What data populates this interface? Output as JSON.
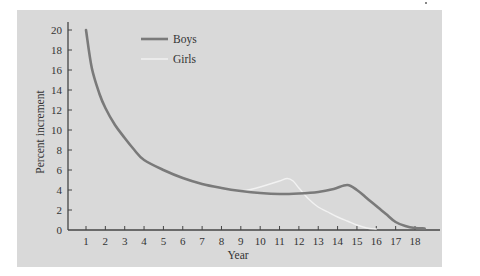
{
  "chart_data": {
    "type": "line",
    "title": "",
    "xlabel": "Year",
    "ylabel": "Percent increment",
    "xlim": [
      0,
      19.2
    ],
    "ylim": [
      0,
      20
    ],
    "x_ticks": [
      1,
      2,
      3,
      4,
      5,
      6,
      7,
      8,
      9,
      10,
      11,
      12,
      13,
      14,
      15,
      16,
      17,
      18
    ],
    "y_ticks": [
      0,
      2,
      4,
      6,
      8,
      10,
      12,
      14,
      16,
      18,
      20
    ],
    "grid": false,
    "legend_position": "upper-left-inside",
    "background": "#d9d9d9",
    "series": [
      {
        "name": "Boys",
        "color": "#7a7a7a",
        "width": 2.6,
        "x": [
          1,
          1.3,
          1.7,
          2,
          2.5,
          3,
          3.5,
          4,
          5,
          6,
          7,
          8,
          9,
          10,
          11,
          12,
          13,
          13.8,
          14.5,
          15,
          15.5,
          16,
          16.5,
          17,
          17.5,
          18,
          18.5
        ],
        "y": [
          20,
          16.2,
          13.6,
          12.2,
          10.5,
          9.2,
          8,
          7,
          6,
          5.2,
          4.6,
          4.2,
          3.9,
          3.7,
          3.6,
          3.65,
          3.8,
          4.1,
          4.5,
          4.0,
          3.2,
          2.4,
          1.6,
          0.8,
          0.4,
          0.2,
          0.15
        ]
      },
      {
        "name": "Girls",
        "color": "#f2f2f2",
        "width": 1.4,
        "x": [
          9,
          9.5,
          10,
          10.5,
          11,
          11.4,
          11.7,
          12,
          12.5,
          13,
          13.5,
          14,
          14.5,
          15,
          15.5,
          16
        ],
        "y": [
          3.9,
          4.05,
          4.3,
          4.6,
          4.9,
          5.15,
          4.9,
          4.2,
          3.1,
          2.3,
          1.8,
          1.3,
          0.9,
          0.5,
          0.2,
          0.1
        ]
      }
    ]
  },
  "legend": {
    "items": [
      {
        "label": "Boys"
      },
      {
        "label": "Girls"
      }
    ]
  },
  "axes": {
    "xlabel": "Year",
    "ylabel": "Percent increment"
  }
}
